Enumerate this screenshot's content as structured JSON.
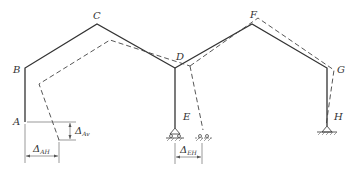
{
  "diagram": {
    "title": "",
    "nodes": {
      "A": {
        "label": "A"
      },
      "B": {
        "label": "B"
      },
      "C": {
        "label": "C"
      },
      "D": {
        "label": "D"
      },
      "E": {
        "label": "E"
      },
      "F": {
        "label": "F"
      },
      "G": {
        "label": "G"
      },
      "H": {
        "label": "H"
      }
    },
    "dimensions": {
      "delta_av": {
        "symbol": "Δ",
        "sub": "Av"
      },
      "delta_ah": {
        "symbol": "Δ",
        "sub": "AH"
      },
      "delta_eh": {
        "symbol": "Δ",
        "sub": "EH"
      }
    },
    "legend": {
      "solid": "original frame",
      "dashed": "deflected shape"
    },
    "supports": {
      "E": "roller",
      "H": "pin"
    }
  }
}
